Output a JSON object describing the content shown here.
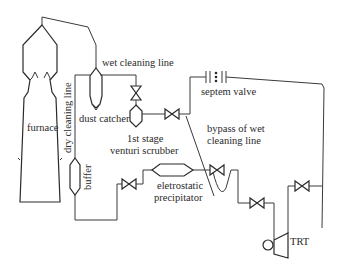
{
  "diagram": {
    "type": "process-flow",
    "labels": {
      "wet_cleaning_line": "wet cleaning line",
      "dust_catcher": "dust catcher",
      "furnace": "furnace",
      "dry_cleaning_line": "dry cleaning line",
      "buffer": "buffer",
      "venturi_line1": "1st stage",
      "venturi_line2": "venturi scrubber",
      "septem_valve": "septem valve",
      "bypass_line1": "bypass of wet",
      "bypass_line2": "cleaning line",
      "precipitator_line1": "eletrostatic",
      "precipitator_line2": "precipitator",
      "trt": "TRT"
    },
    "components": [
      "furnace",
      "dust catcher",
      "buffer",
      "1st stage venturi scrubber",
      "septem valve",
      "eletrostatic precipitator",
      "TRT"
    ],
    "colors": {
      "line": "#3a3a3a",
      "background": "#ffffff"
    }
  }
}
